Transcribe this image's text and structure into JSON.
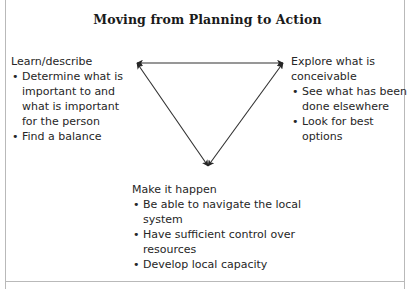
{
  "figure": {
    "title": "Moving from Planning to Action",
    "line_color": "#303030",
    "text_color": "#262626",
    "background": "#ffffff",
    "frame_color": "#b9b9b9",
    "bullet_glyph": "•"
  },
  "diagram": {
    "shape": "inverted-triangle",
    "vertices": [
      {
        "id": "top-left",
        "x": 137,
        "y": 63
      },
      {
        "id": "top-right",
        "x": 283,
        "y": 63
      },
      {
        "id": "bottom",
        "x": 208,
        "y": 166
      }
    ],
    "edges": [
      {
        "from": "top-left",
        "to": "top-right",
        "arrowheads": "both"
      },
      {
        "from": "top-right",
        "to": "bottom",
        "arrowheads": "both"
      },
      {
        "from": "bottom",
        "to": "top-left",
        "arrowheads": "both"
      }
    ]
  },
  "blocks": {
    "learn": {
      "heading": "Learn/describe",
      "items": [
        "Determine what is important to and what is important for the person",
        "Find a balance"
      ]
    },
    "explore": {
      "heading": "Explore what is conceivable",
      "items": [
        "See what has been done elsewhere",
        "Look for best options"
      ]
    },
    "make": {
      "heading": "Make it happen",
      "items": [
        "Be able to navigate the local system",
        "Have sufficient control over resources",
        "Develop local capacity"
      ]
    }
  }
}
